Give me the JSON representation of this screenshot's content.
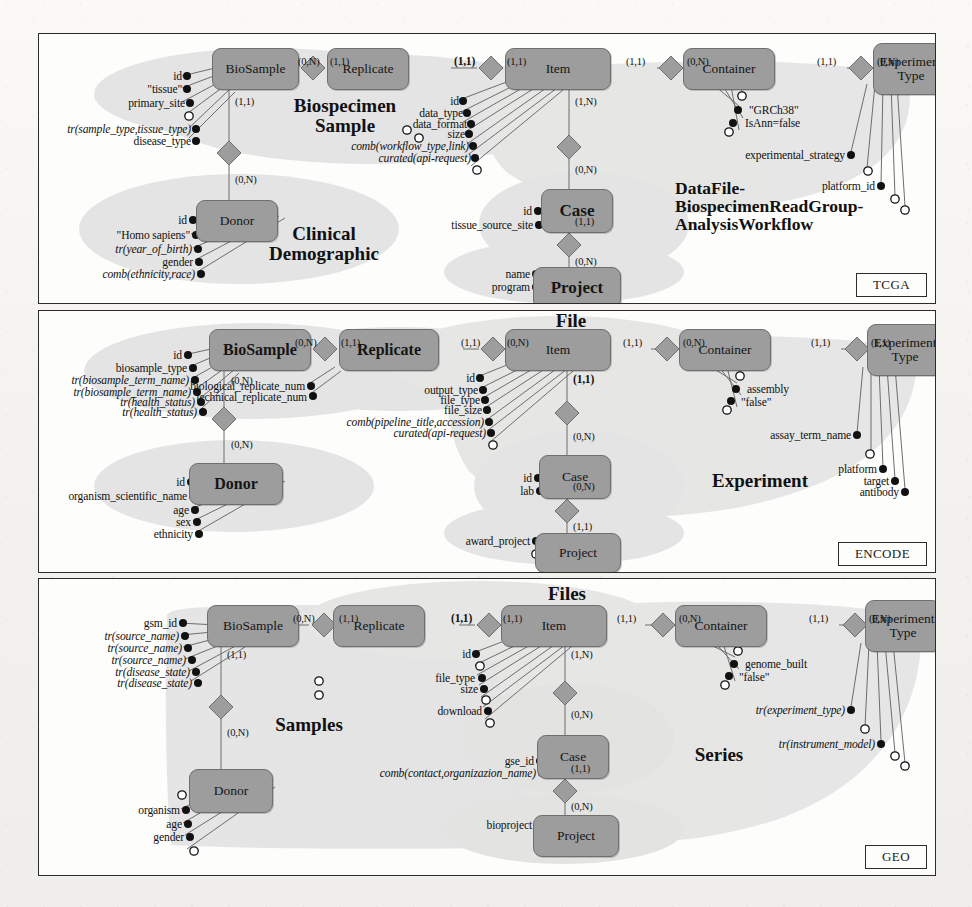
{
  "figure": {
    "legend_shapes": {
      "entity": "rounded-rectangle",
      "relationship": "diamond",
      "attribute_filled": "filled-circle",
      "attribute_empty": "hollow-circle"
    }
  },
  "panels": [
    {
      "id": "tcga",
      "tag": "TCGA",
      "entities": [
        {
          "name": "BioSample",
          "style": "reg"
        },
        {
          "name": "Replicate",
          "style": "reg"
        },
        {
          "name": "Item",
          "style": "reg"
        },
        {
          "name": "Container",
          "style": "reg"
        },
        {
          "name": "Experiment Type",
          "style": "reg",
          "line1": "Experiment",
          "line2": "Type"
        },
        {
          "name": "Donor",
          "style": "reg"
        },
        {
          "name": "Case",
          "style": "big"
        },
        {
          "name": "Project",
          "style": "big"
        }
      ],
      "regions": [
        {
          "label": "Biospecimen Sample",
          "line1": "Biospecimen",
          "line2": "Sample"
        },
        {
          "label": "Clinical Demographic",
          "line1": "Clinical",
          "line2": "Demographic"
        },
        {
          "label": "DataFile-BiospecimenReadGroup-AnalysisWorkflow",
          "line1": "DataFile-",
          "line2": "BiospecimenReadGroup-",
          "line3": "AnalysisWorkflow"
        }
      ],
      "cardinalities": [
        "(0,N)",
        "(1,1)",
        "(1,1)",
        "(1,1)",
        "(1,1)",
        "(0,N)",
        "(1,1)",
        "(0,N)",
        "(1,1)",
        "(1,N)",
        "(0,N)",
        "(1,1)",
        "(0,N)",
        "(0,N)"
      ],
      "attributes": {
        "biosample": [
          "id",
          "\"tissue\"",
          "primary_site",
          "",
          "tr(sample_type,tissue_type)",
          "disease_type"
        ],
        "item": [
          "id",
          "data_type",
          "data_format",
          "size",
          "comb(workflow_type,link)",
          "curated(api-request)",
          ""
        ],
        "container": [
          "",
          "\"GRCh38\"",
          "IsAnn=false",
          ""
        ],
        "experiment_type": [
          "experimental_strategy",
          "",
          "platform_id",
          "",
          ""
        ],
        "donor": [
          "id",
          "\"Homo sapiens\"",
          "tr(year_of_birth)",
          "gender",
          "comb(ethnicity,race)"
        ],
        "case": [
          "id",
          "tissue_source_site"
        ],
        "project": [
          "name",
          "program"
        ]
      }
    },
    {
      "id": "encode",
      "tag": "ENCODE",
      "entities": [
        {
          "name": "BioSample",
          "style": "bold"
        },
        {
          "name": "Replicate",
          "style": "bold"
        },
        {
          "name": "Item",
          "style": "reg"
        },
        {
          "name": "Container",
          "style": "reg"
        },
        {
          "name": "Experiment Type",
          "style": "reg",
          "line1": "Experiment",
          "line2": "Type"
        },
        {
          "name": "Donor",
          "style": "bold"
        },
        {
          "name": "Case",
          "style": "reg"
        },
        {
          "name": "Project",
          "style": "reg"
        }
      ],
      "regions": [
        {
          "label": "File",
          "line1": "File"
        },
        {
          "label": "Experiment",
          "line1": "Experiment"
        }
      ],
      "cardinalities": [
        "(0,N)",
        "(1,1)",
        "(1,1)",
        "(0,N)",
        "(1,1)",
        "(0,N)",
        "(1,1)",
        "(1,1)",
        "(0,N)",
        "(1,1)",
        "(0,N)",
        "(0,N)"
      ],
      "attributes": {
        "biosample": [
          "id",
          "biosample_type",
          "tr(biosample_term_name)",
          "tr(biosample_term_name)",
          "tr(health_status)",
          "tr(health_status)"
        ],
        "replicate": [
          "biological_replicate_num",
          "technical_replicate_num"
        ],
        "item": [
          "id",
          "output_type",
          "file_type",
          "file_size",
          "comb(pipeline_title,accession)",
          "curated(api-request)",
          ""
        ],
        "container": [
          "",
          "assembly",
          "\"false\"",
          ""
        ],
        "experiment_type": [
          "assay_term_name",
          "",
          "platform",
          "target",
          "antibody"
        ],
        "donor": [
          "id",
          "organism_scientific_name",
          "age",
          "sex",
          "ethnicity"
        ],
        "case": [
          "id",
          "lab"
        ],
        "project": [
          "award_project",
          ""
        ]
      }
    },
    {
      "id": "geo",
      "tag": "GEO",
      "entities": [
        {
          "name": "BioSample",
          "style": "reg"
        },
        {
          "name": "Replicate",
          "style": "reg"
        },
        {
          "name": "Item",
          "style": "reg"
        },
        {
          "name": "Container",
          "style": "reg"
        },
        {
          "name": "Experiment Type",
          "style": "reg",
          "line1": "Experiment",
          "line2": "Type"
        },
        {
          "name": "Donor",
          "style": "reg"
        },
        {
          "name": "Case",
          "style": "reg"
        },
        {
          "name": "Project",
          "style": "reg"
        }
      ],
      "regions": [
        {
          "label": "Files",
          "line1": "Files"
        },
        {
          "label": "Samples",
          "line1": "Samples"
        },
        {
          "label": "Series",
          "line1": "Series"
        }
      ],
      "cardinalities": [
        "(0,N)",
        "(1,1)",
        "(1,1)",
        "(1,1)",
        "(1,1)",
        "(0,N)",
        "(1,1)",
        "(0,N)",
        "(1,1)",
        "(1,N)",
        "(0,N)",
        "(1,1)",
        "(0,N)",
        "(0,N)"
      ],
      "attributes": {
        "biosample": [
          "gsm_id",
          "tr(source_name)",
          "tr(source_name)",
          "tr(source_name)",
          "tr(disease_state)",
          "tr(disease_state)"
        ],
        "replicate": [
          "",
          ""
        ],
        "item": [
          "id",
          "",
          "file_type",
          "size",
          "",
          "download",
          ""
        ],
        "container": [
          "",
          "genome_built",
          "\"false\"",
          ""
        ],
        "experiment_type": [
          "tr(experiment_type)",
          "",
          "tr(instrument_model)",
          "",
          ""
        ],
        "donor": [
          "",
          "organism",
          "age",
          "gender",
          ""
        ],
        "case": [
          "gse_id",
          "comb(contact,organizazion_name)"
        ],
        "project": [
          "bioproject",
          ""
        ]
      }
    }
  ],
  "colors": {
    "entity_fill": "#9d9d9d",
    "entity_stroke": "#6f6f6f",
    "cluster_fill": "#d8d8d8",
    "panel_border": "#2b2b2b",
    "paper": "#f3f2ee",
    "ink": "#111111"
  }
}
